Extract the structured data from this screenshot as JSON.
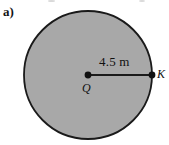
{
  "figure": {
    "part_label": "a)",
    "background_color": "#ffffff",
    "shape": {
      "kind": "circle",
      "name": "shaded-disk",
      "fill_color": "#a8a8a8",
      "stroke_color": "#1a1a1a",
      "stroke_width": 1.8,
      "center_x": 88,
      "center_y": 75,
      "radius": 64
    },
    "radius_line": {
      "name": "radius-segment",
      "from_x": 88,
      "from_y": 75,
      "to_x": 152,
      "to_y": 75,
      "stroke_color": "#1a1a1a",
      "stroke_width": 2.2,
      "dimension_text": "4.5 m"
    },
    "points": [
      {
        "name": "center-point",
        "label": "Q",
        "x": 88,
        "y": 75,
        "dot_radius": 3.4
      },
      {
        "name": "edge-point",
        "label": "K",
        "x": 152,
        "y": 75,
        "dot_radius": 3.4
      }
    ]
  },
  "chart_data": {
    "type": "diagram",
    "title": "a)",
    "elements": [
      {
        "type": "circle",
        "center_label": "Q",
        "perimeter_point_label": "K",
        "radius_value": 4.5,
        "radius_unit": "m",
        "fill": "#a8a8a8"
      }
    ],
    "annotations": [
      "4.5 m",
      "Q",
      "K",
      "a)"
    ]
  }
}
